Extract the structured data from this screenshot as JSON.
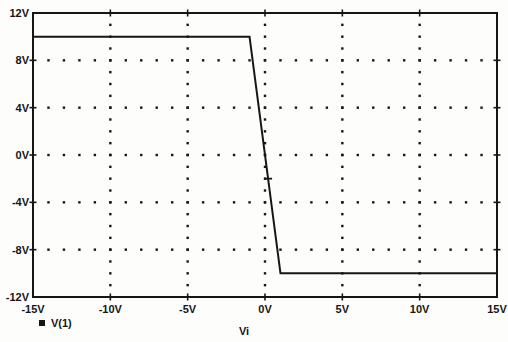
{
  "figure": {
    "background": "#fdfdfb",
    "ink_color": "#161616"
  },
  "legend": {
    "marker": "filled-square",
    "label": "V(1)"
  },
  "chart_data": {
    "type": "line",
    "title": "",
    "xlabel": "Vi",
    "ylabel": "",
    "xlim": [
      -15,
      15
    ],
    "ylim": [
      -12,
      12
    ],
    "x_ticks": [
      {
        "value": -15,
        "label": "-15V"
      },
      {
        "value": -10,
        "label": "-10V"
      },
      {
        "value": -5,
        "label": "-5V"
      },
      {
        "value": 0,
        "label": "0V"
      },
      {
        "value": 5,
        "label": "5V"
      },
      {
        "value": 10,
        "label": "10V"
      },
      {
        "value": 15,
        "label": "15V"
      }
    ],
    "y_ticks": [
      {
        "value": 12,
        "label": "12V"
      },
      {
        "value": 8,
        "label": "8V"
      },
      {
        "value": 4,
        "label": "4V"
      },
      {
        "value": 0,
        "label": "0V"
      },
      {
        "value": -4,
        "label": "-4V"
      },
      {
        "value": -8,
        "label": "-8V"
      },
      {
        "value": -12,
        "label": "-12V"
      }
    ],
    "grid": {
      "style": "dotted",
      "x_minor_step": 1,
      "y_minor_step": 1,
      "legend_position": "bottom-left"
    },
    "series": [
      {
        "name": "V(1)",
        "points": [
          [
            -15,
            10
          ],
          [
            -1,
            10
          ],
          [
            1,
            -10
          ],
          [
            15,
            -10
          ]
        ],
        "description": "Output saturates at +10V for Vi < -1V, drops linearly (gain -10) to -10V at Vi = +1V, saturates at -10V beyond."
      }
    ],
    "annotations": {
      "curve_dash_marker": {
        "x": 0.2,
        "y": -2.0
      }
    }
  }
}
